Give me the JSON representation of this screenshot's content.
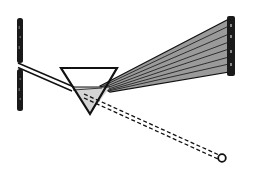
{
  "diagram": {
    "title": "",
    "colors": {
      "ink": "#111111",
      "spectrum_fill": "#9a9a9a",
      "prism_fill": "#d9d9d9",
      "background": "#ffffff"
    },
    "elements": [
      {
        "id": "slit-screen",
        "label": ""
      },
      {
        "id": "incident-beam",
        "label": ""
      },
      {
        "id": "prism",
        "label": ""
      },
      {
        "id": "spectrum-fan",
        "label": "",
        "band_count": 7
      },
      {
        "id": "spectrum-screen",
        "label": ""
      },
      {
        "id": "dashed-ray",
        "label": ""
      },
      {
        "id": "observer-point",
        "label": ""
      }
    ]
  }
}
